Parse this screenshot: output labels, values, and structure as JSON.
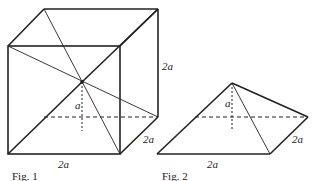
{
  "figures": [
    {
      "id": "fig1",
      "caption": "Fig. 1",
      "shape": "cube with diagonals",
      "labels": {
        "height": "2a",
        "depth": "2a",
        "width": "2a",
        "inner": "a"
      }
    },
    {
      "id": "fig2",
      "caption": "Fig. 2",
      "shape": "square pyramid",
      "labels": {
        "height": "a",
        "depth": "2a",
        "width": "2a"
      }
    }
  ],
  "colors": {
    "line": "#222222",
    "background": "#ffffff"
  }
}
